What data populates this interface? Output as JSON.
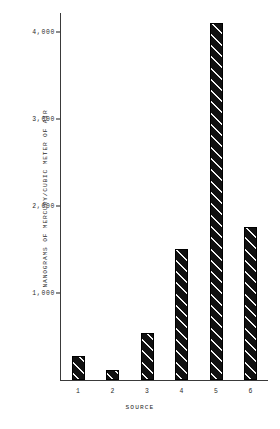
{
  "chart_data": {
    "type": "bar",
    "title": "",
    "subtitle": "",
    "categories": [
      "1",
      "2",
      "3",
      "4",
      "5",
      "6"
    ],
    "values": [
      280,
      110,
      540,
      1500,
      4100,
      1760
    ],
    "xlabel": "SOURCE",
    "ylabel": "NANOGRAMS OF MERCURY/CUBIC METER OF AIR",
    "ylim": [
      0,
      4250
    ],
    "yticks": [
      1000,
      2000,
      3000,
      4000
    ],
    "ytick_labels": [
      "1,000",
      "2,000",
      "3,000",
      "4,000"
    ],
    "xtick_labels": [
      "1",
      "2",
      "3",
      "4",
      "5",
      "6"
    ],
    "grid": false,
    "legend": null,
    "bar_fill": "#111111",
    "bar_hatch": "diagonal-stripes",
    "axis_color": "#3a3a3a",
    "background": "#ffffff"
  }
}
